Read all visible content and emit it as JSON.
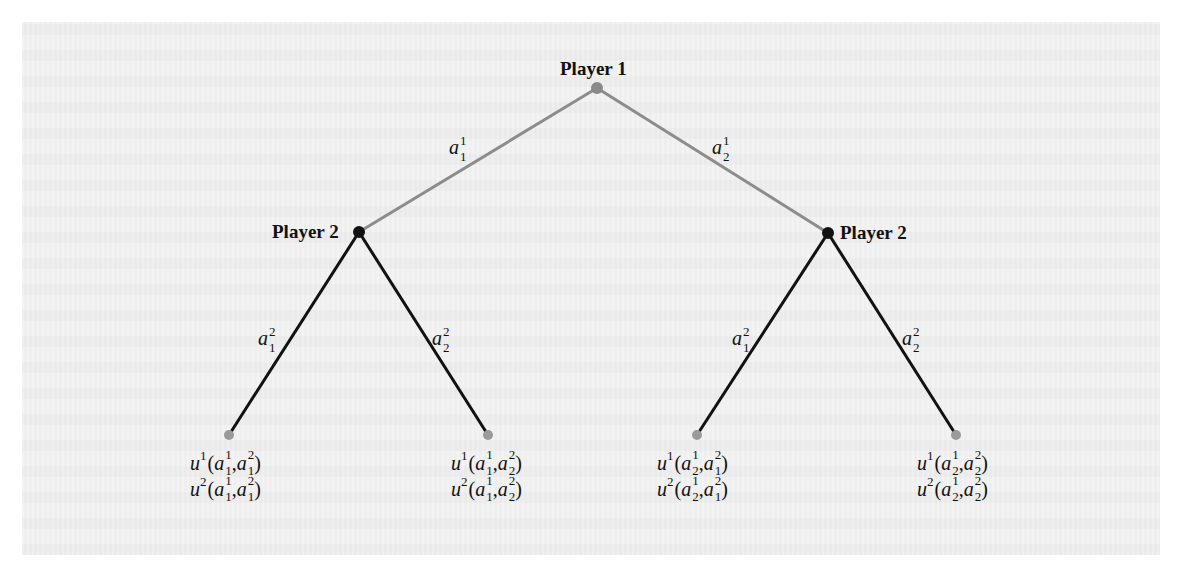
{
  "figure": {
    "type": "extensive-form game tree",
    "colors": {
      "background_panel": "#efefef",
      "page": "#ffffff",
      "player1_edges": "#8c8c8c",
      "player2_edges": "#111111",
      "root_node": "#8a8a8a",
      "player2_nodes": "#111111",
      "leaf_nodes": "#9a9a9a",
      "text": "#111111"
    },
    "nodes": {
      "root": {
        "label": "Player 1",
        "x": 597,
        "y": 88
      },
      "p2_left": {
        "label": "Player 2",
        "x": 359,
        "y": 232
      },
      "p2_right": {
        "label": "Player 2",
        "x": 828,
        "y": 233
      }
    },
    "player1_actions": [
      {
        "letter": "a",
        "sub": "1",
        "sup": "1",
        "to": "p2_left"
      },
      {
        "letter": "a",
        "sub": "2",
        "sup": "1",
        "to": "p2_right"
      }
    ],
    "player2_actions_left": [
      {
        "letter": "a",
        "sub": "1",
        "sup": "2"
      },
      {
        "letter": "a",
        "sub": "2",
        "sup": "2"
      }
    ],
    "player2_actions_right": [
      {
        "letter": "a",
        "sub": "1",
        "sup": "2"
      },
      {
        "letter": "a",
        "sub": "2",
        "sup": "2"
      }
    ],
    "leaves": [
      {
        "x": 229,
        "y": 435,
        "payoffs": [
          {
            "fn": "u",
            "player": "1",
            "a1_sub": "1",
            "a1_sup": "1",
            "a2_sub": "1",
            "a2_sup": "2"
          },
          {
            "fn": "u",
            "player": "2",
            "a1_sub": "1",
            "a1_sup": "1",
            "a2_sub": "1",
            "a2_sup": "2"
          }
        ]
      },
      {
        "x": 488,
        "y": 435,
        "payoffs": [
          {
            "fn": "u",
            "player": "1",
            "a1_sub": "1",
            "a1_sup": "1",
            "a2_sub": "2",
            "a2_sup": "2"
          },
          {
            "fn": "u",
            "player": "2",
            "a1_sub": "1",
            "a1_sup": "1",
            "a2_sub": "2",
            "a2_sup": "2"
          }
        ]
      },
      {
        "x": 697,
        "y": 435,
        "payoffs": [
          {
            "fn": "u",
            "player": "1",
            "a1_sub": "2",
            "a1_sup": "1",
            "a2_sub": "1",
            "a2_sup": "2"
          },
          {
            "fn": "u",
            "player": "2",
            "a1_sub": "2",
            "a1_sup": "1",
            "a2_sub": "1",
            "a2_sup": "2"
          }
        ]
      },
      {
        "x": 956,
        "y": 435,
        "payoffs": [
          {
            "fn": "u",
            "player": "1",
            "a1_sub": "2",
            "a1_sup": "1",
            "a2_sub": "2",
            "a2_sup": "2"
          },
          {
            "fn": "u",
            "player": "2",
            "a1_sub": "2",
            "a1_sup": "1",
            "a2_sub": "2",
            "a2_sup": "2"
          }
        ]
      }
    ],
    "punct": {
      "open": "(",
      "comma": ", ",
      "close": ")"
    }
  }
}
